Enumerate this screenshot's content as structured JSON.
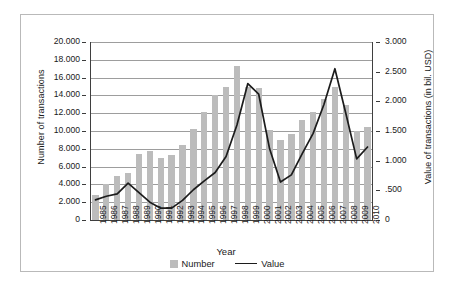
{
  "chart_data": {
    "type": "bar",
    "title": "",
    "subtitle": "",
    "xlabel": "Year",
    "ylabel": "Number of transactions",
    "y2label": "Value of transactions (in bil. USD)",
    "grid": true,
    "legend_position": "bottom",
    "categories": [
      "1985",
      "1986",
      "1987",
      "1988",
      "1989",
      "1990",
      "1991",
      "1992",
      "1993",
      "1994",
      "1995",
      "1996",
      "1997",
      "1998",
      "1999",
      "2000",
      "2001",
      "2002",
      "2003",
      "2004",
      "2005",
      "2006",
      "2007",
      "2008",
      "2009",
      "2010"
    ],
    "ylim": [
      0,
      20000
    ],
    "yticks": [
      0,
      2000,
      4000,
      6000,
      8000,
      10000,
      12000,
      14000,
      16000,
      18000,
      20000
    ],
    "ytick_labels": [
      "0",
      "2.000",
      "4.000",
      "6.000",
      "8.000",
      "10.000",
      "12.000",
      "14.000",
      "16.000",
      "18.000",
      "20.000"
    ],
    "y2lim": [
      0,
      3.0
    ],
    "y2ticks": [
      0,
      0.5,
      1.0,
      1.5,
      2.0,
      2.5,
      3.0
    ],
    "y2tick_labels": [
      "0",
      ".500",
      "1.000",
      "1.500",
      "2.000",
      "2.500",
      "3.000"
    ],
    "series": [
      {
        "name": "Number",
        "type": "bar",
        "axis": "left",
        "color": "#bcbcbc",
        "values": [
          2800,
          4000,
          4900,
          5300,
          7400,
          7700,
          7000,
          7300,
          8450,
          10250,
          12100,
          14000,
          15000,
          17250,
          14900,
          14800,
          10150,
          9000,
          9700,
          11200,
          12100,
          13600,
          14950,
          12900,
          10000,
          10500
        ]
      },
      {
        "name": "Value",
        "type": "line",
        "axis": "right",
        "color": "#1c1c1c",
        "values": [
          0.34,
          0.4,
          0.44,
          0.62,
          0.46,
          0.3,
          0.2,
          0.2,
          0.33,
          0.51,
          0.66,
          0.8,
          1.07,
          1.6,
          2.3,
          2.12,
          1.2,
          0.64,
          0.76,
          1.12,
          1.46,
          1.95,
          2.55,
          1.8,
          1.03,
          1.23
        ]
      }
    ]
  },
  "legend": {
    "items": [
      {
        "label": "Number",
        "marker": "square-swatch"
      },
      {
        "label": "Value",
        "marker": "line-swatch"
      }
    ]
  }
}
